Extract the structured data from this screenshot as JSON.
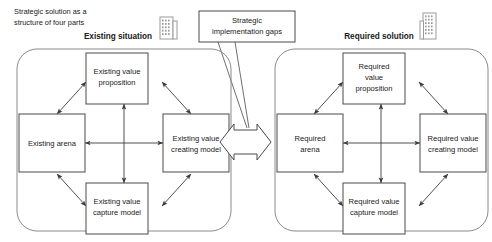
{
  "caption": {
    "line1": "Strategic solution as a",
    "line2": "structure of four parts"
  },
  "headers": {
    "left": "Existing situation",
    "right": "Required solution"
  },
  "callout": {
    "line1": "Strategic",
    "line2": "implementation gaps"
  },
  "left_panel": {
    "top": {
      "line1": "Existing value",
      "line2": "proposition"
    },
    "left": {
      "line1": "Existing arena",
      "line2": ""
    },
    "right": {
      "line1": "Existing value",
      "line2": "creating model"
    },
    "bottom": {
      "line1": "Existing value",
      "line2": "capture model"
    }
  },
  "right_panel": {
    "top": {
      "line1": "Required",
      "line2": "value",
      "line3": "proposition"
    },
    "left": {
      "line1": "Required",
      "line2": "arena"
    },
    "right": {
      "line1": "Required value",
      "line2": "creating model"
    },
    "bottom": {
      "line1": "Required value",
      "line2": "capture model"
    }
  },
  "icons": {
    "left_building": "building-icon",
    "right_building": "building-icon"
  },
  "colors": {
    "text": "#1a1a1a",
    "box_stroke": "#4a4a4a",
    "panel_stroke": "#8a8a8a",
    "background": "#ffffff"
  }
}
